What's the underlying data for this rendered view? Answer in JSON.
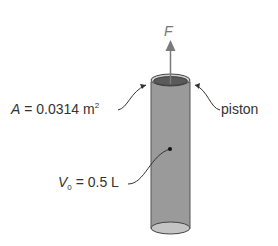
{
  "diagram": {
    "force_label": "F",
    "area": {
      "var": "A",
      "eq": " = 0.0314 m",
      "exp": "2"
    },
    "piston_label": "piston",
    "volume": {
      "var": "V",
      "sub": "0",
      "eq": " = 0.5 L"
    },
    "colors": {
      "cylinder": "#9a9a9a",
      "piston_top": "#555555",
      "rim": "#c8c8c8",
      "arrow": "#7a7a7a",
      "text": "#333333"
    }
  }
}
